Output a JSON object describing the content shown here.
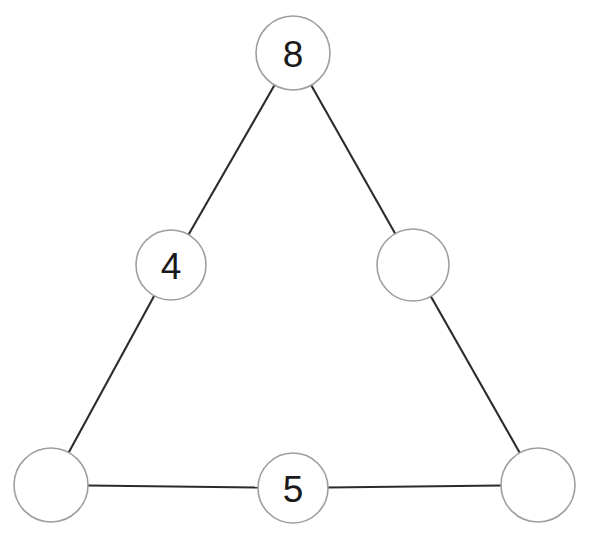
{
  "diagram": {
    "background_color": "#ffffff",
    "node_fill_color": "#ffffff",
    "node_stroke_color": "#9e9e9e",
    "edge_color": "#2b2b2b",
    "label_color": "#1a1a1a",
    "nodes": [
      {
        "id": "top",
        "label": "8",
        "filled": true,
        "cx": 293,
        "cy": 53,
        "r": 37
      },
      {
        "id": "left-middle",
        "label": "4",
        "filled": true,
        "cx": 171,
        "cy": 265,
        "r": 35
      },
      {
        "id": "right-middle",
        "label": "",
        "filled": false,
        "cx": 413,
        "cy": 265,
        "r": 36
      },
      {
        "id": "bottom-left",
        "label": "",
        "filled": false,
        "cx": 51,
        "cy": 485,
        "r": 37
      },
      {
        "id": "bottom-middle",
        "label": "5",
        "filled": true,
        "cx": 293,
        "cy": 488,
        "r": 35
      },
      {
        "id": "bottom-right",
        "label": "",
        "filled": false,
        "cx": 538,
        "cy": 485,
        "r": 37
      }
    ],
    "edges": [
      {
        "id": "edge-top-to-left-middle",
        "from": "top",
        "to": "left-middle"
      },
      {
        "id": "edge-left-middle-to-bottom-left",
        "from": "left-middle",
        "to": "bottom-left"
      },
      {
        "id": "edge-top-to-right-middle",
        "from": "top",
        "to": "right-middle"
      },
      {
        "id": "edge-right-middle-to-bottom-right",
        "from": "right-middle",
        "to": "bottom-right"
      },
      {
        "id": "edge-bottom-left-to-bottom-middle",
        "from": "bottom-left",
        "to": "bottom-middle"
      },
      {
        "id": "edge-bottom-middle-to-bottom-right",
        "from": "bottom-middle",
        "to": "bottom-right"
      }
    ]
  }
}
